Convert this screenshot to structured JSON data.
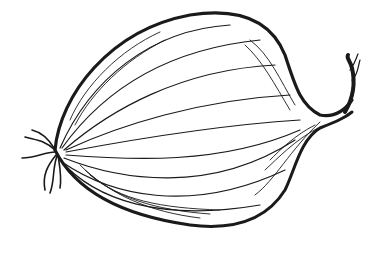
{
  "image": {
    "subject": "onion",
    "style": "pen-and-ink line drawing",
    "background_color": "#ffffff",
    "ink_color": "#1a1a1a"
  }
}
